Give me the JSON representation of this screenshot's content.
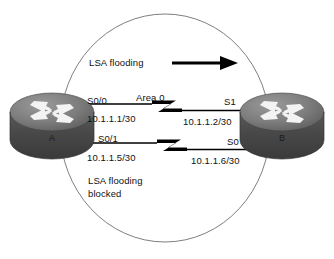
{
  "diagram": {
    "area_label": "Area 0",
    "flooding_label": "LSA flooding",
    "blocked_label": "LSA flooding\nblocked",
    "colors": {
      "ellipse_stroke": "#6b6b6b",
      "link_stroke": "#000000",
      "arrow_fill": "#000000",
      "router_body_dark": "#4a4a4a",
      "router_body_mid": "#7a7a7a",
      "router_top_light": "#8e8e8e",
      "router_arrow": "#f2f2f2",
      "text": "#111111"
    }
  },
  "routers": [
    {
      "name": "A",
      "id": "router-a",
      "interfaces": [
        {
          "id": "s0-0",
          "name": "S0/0",
          "address": "10.1.1.1/30"
        },
        {
          "id": "s0-1",
          "name": "S0/1",
          "address": "10.1.1.5/30"
        }
      ]
    },
    {
      "name": "B",
      "id": "router-b",
      "interfaces": [
        {
          "id": "s1",
          "name": "S1",
          "address": "10.1.1.2/30"
        },
        {
          "id": "s0",
          "name": "S0",
          "address": "10.1.1.6/30"
        }
      ]
    }
  ],
  "links": [
    {
      "id": "link-top",
      "left_interface": "S0/0",
      "left_address": "10.1.1.1/30",
      "right_interface": "S1",
      "right_address": "10.1.1.2/30",
      "label": "Area 0"
    },
    {
      "id": "link-bottom",
      "left_interface": "S0/1",
      "left_address": "10.1.1.5/30",
      "right_interface": "S0",
      "right_address": "10.1.1.6/30",
      "label": ""
    }
  ],
  "annotations": {
    "flooding": "LSA flooding",
    "flooding_blocked": "LSA flooding\nblocked",
    "area": "Area 0",
    "arrow_direction": "right"
  }
}
